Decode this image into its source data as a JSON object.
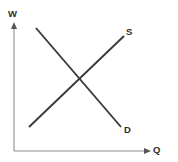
{
  "chart_data": {
    "type": "line",
    "title": "",
    "subtitle": "",
    "xlabel": "Q",
    "ylabel": "W",
    "xlim": [
      0,
      10
    ],
    "ylim": [
      0,
      10
    ],
    "grid": false,
    "legend": "inline-endpoint-labels",
    "axis_arrows": true,
    "annotations": [
      {
        "text": "S",
        "x": 9.05,
        "y": 9.15,
        "meaning": "supply-curve-label"
      },
      {
        "text": "D",
        "x": 9.25,
        "y": 1.45,
        "meaning": "demand-curve-label"
      },
      {
        "text": "W",
        "x": 0.0,
        "y": 10.4,
        "meaning": "y-axis-label-wage"
      },
      {
        "text": "Q",
        "x": 10.6,
        "y": 0.0,
        "meaning": "x-axis-label-quantity"
      }
    ],
    "series": [
      {
        "name": "S",
        "label": "S",
        "description": "Upward sloping supply curve",
        "color": "#3a3a3a",
        "points": [
          {
            "x": 1.2,
            "y": 2.0
          },
          {
            "x": 8.4,
            "y": 9.1
          }
        ]
      },
      {
        "name": "D",
        "label": "D",
        "description": "Downward sloping demand curve",
        "color": "#3a3a3a",
        "points": [
          {
            "x": 1.7,
            "y": 9.8
          },
          {
            "x": 8.2,
            "y": 2.0
          }
        ]
      }
    ],
    "equilibrium": {
      "x": 4.8,
      "y": 5.7,
      "marked": false
    }
  },
  "labels": {
    "y_axis": "W",
    "x_axis": "Q",
    "supply": "S",
    "demand": "D"
  },
  "colors": {
    "background": "#ffffff",
    "axis": "#8d8d8d",
    "arrow": "#555555",
    "curve": "#3a3a3a",
    "label_text": "#2b2b2b"
  },
  "geometry": {
    "origin": {
      "x": 14,
      "y": 151
    },
    "y_axis_top": {
      "x": 14,
      "y": 25
    },
    "x_axis_right": {
      "x": 150,
      "y": 151
    },
    "supply_start": {
      "x": 29,
      "y": 127
    },
    "supply_end": {
      "x": 124,
      "y": 36
    },
    "demand_start": {
      "x": 36,
      "y": 28
    },
    "demand_end": {
      "x": 121,
      "y": 127
    },
    "intersection": {
      "x": 77,
      "y": 80
    }
  }
}
